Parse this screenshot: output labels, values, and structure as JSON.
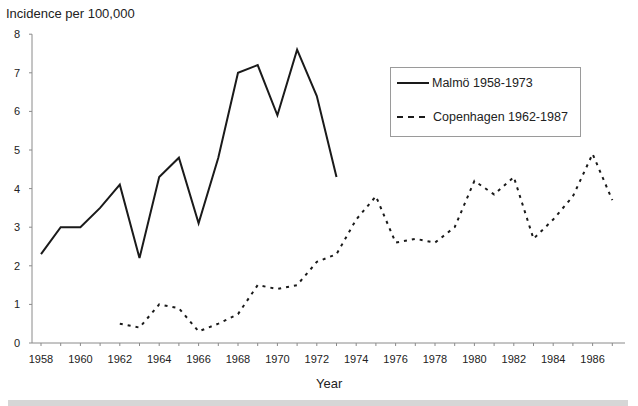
{
  "chart_data": {
    "type": "line",
    "title": "",
    "ylabel": "Incidence per 100,000",
    "xlabel": "Year",
    "ylim": [
      0,
      8
    ],
    "xlim": [
      1958,
      1987
    ],
    "yticks": [
      0,
      1,
      2,
      3,
      4,
      5,
      6,
      7,
      8
    ],
    "xticks": [
      1958,
      1960,
      1962,
      1964,
      1966,
      1968,
      1970,
      1972,
      1974,
      1976,
      1978,
      1980,
      1982,
      1984,
      1986
    ],
    "grid": false,
    "legend_position": "upper right",
    "series": [
      {
        "name": "Malmö 1958-1973",
        "style": "solid",
        "x": [
          1958,
          1959,
          1960,
          1961,
          1962,
          1963,
          1964,
          1965,
          1966,
          1967,
          1968,
          1969,
          1970,
          1971,
          1972,
          1973
        ],
        "values": [
          2.3,
          3.0,
          3.0,
          3.5,
          4.1,
          2.2,
          4.3,
          4.8,
          3.1,
          4.8,
          7.0,
          7.2,
          5.9,
          7.6,
          6.4,
          4.3
        ]
      },
      {
        "name": "Copenhagen 1962-1987",
        "style": "dashed",
        "x": [
          1962,
          1963,
          1964,
          1965,
          1966,
          1967,
          1968,
          1969,
          1970,
          1971,
          1972,
          1973,
          1974,
          1975,
          1976,
          1977,
          1978,
          1979,
          1980,
          1981,
          1982,
          1983,
          1984,
          1985,
          1986,
          1987
        ],
        "values": [
          0.5,
          0.4,
          1.0,
          0.9,
          0.3,
          0.5,
          0.75,
          1.5,
          1.4,
          1.5,
          2.1,
          2.3,
          3.2,
          3.8,
          2.6,
          2.7,
          2.6,
          3.0,
          4.2,
          3.85,
          4.3,
          2.7,
          3.2,
          3.8,
          4.9,
          3.7
        ]
      }
    ]
  },
  "labels": {
    "y_title": "Incidence per 100,000",
    "x_title": "Year",
    "legend_malmo": "Malmö 1958-1973",
    "legend_copenhagen": "Copenhagen 1962-1987"
  }
}
